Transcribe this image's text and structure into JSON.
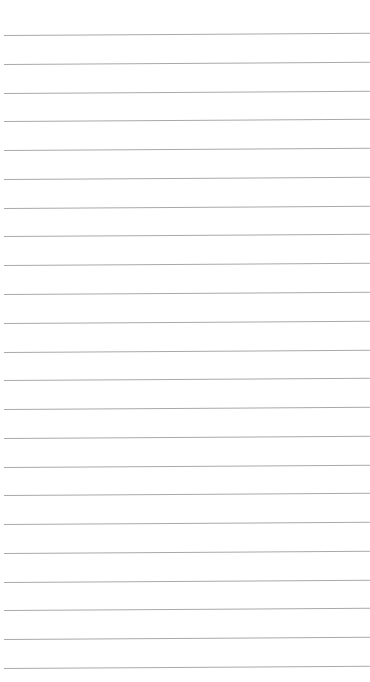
{
  "page": {
    "type": "lined-paper",
    "background_color": "#ffffff",
    "rule_color": "#a9a9a9",
    "rule_count": 23
  }
}
